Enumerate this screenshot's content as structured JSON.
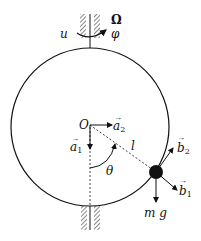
{
  "diagram": {
    "labels": {
      "u": "u",
      "Omega": "Ω",
      "phi": "φ",
      "origin": "O",
      "a1": "a",
      "a1_sub": "1",
      "a2": "a",
      "a2_sub": "2",
      "length": "l",
      "theta": "θ",
      "b1": "b",
      "b1_sub": "1",
      "b2": "b",
      "b2_sub": "2",
      "weight": "m g"
    },
    "colors": {
      "stroke": "#111111",
      "background": "#ffffff"
    }
  }
}
